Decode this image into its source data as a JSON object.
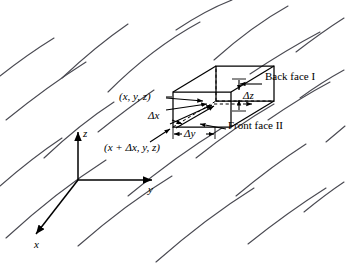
{
  "figure": {
    "kind": "fluid-control-volume-diagram",
    "background": "#ffffff",
    "ink": "#000000",
    "streamline_color": "#4a4a52",
    "width": 346,
    "height": 264
  },
  "axes": {
    "x_label": "x",
    "y_label": "y",
    "z_label": "z",
    "origin": [
      78,
      180
    ]
  },
  "cube": {
    "front_bottom_left": [
      173,
      127
    ],
    "front_top_right": [
      231,
      92
    ],
    "depth_dx": 43,
    "depth_dy": -26
  },
  "labels": {
    "corner_near": "(x, y, z)",
    "corner_far": "(x + Δx, y, z)",
    "delta_x": "Δx",
    "delta_y": "Δy",
    "delta_z": "Δz",
    "back_face": "Back face I",
    "front_face": "Front face II"
  }
}
